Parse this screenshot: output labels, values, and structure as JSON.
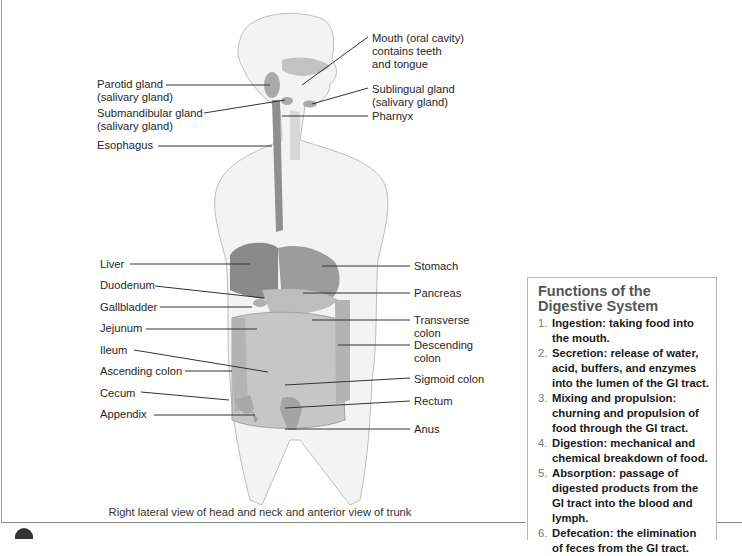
{
  "labels_left": [
    {
      "text": "Parotid gland\n(salivary gland)"
    },
    {
      "text": "Submandibular gland\n(salivary gland)"
    },
    {
      "text": "Esophagus"
    },
    {
      "text": "Liver"
    },
    {
      "text": "Duodenum"
    },
    {
      "text": "Gallbladder"
    },
    {
      "text": "Jejunum"
    },
    {
      "text": "Ileum"
    },
    {
      "text": "Ascending colon"
    },
    {
      "text": "Cecum"
    },
    {
      "text": "Appendix"
    }
  ],
  "labels_right": [
    {
      "text": "Mouth (oral cavity)\ncontains teeth\nand tongue"
    },
    {
      "text": "Sublingual gland\n(salivary gland)"
    },
    {
      "text": "Pharnyx"
    },
    {
      "text": "Stomach"
    },
    {
      "text": "Pancreas"
    },
    {
      "text": "Transverse\ncolon"
    },
    {
      "text": "Descending\ncolon"
    },
    {
      "text": "Sigmoid colon"
    },
    {
      "text": "Rectum"
    },
    {
      "text": "Anus"
    }
  ],
  "caption": "Right lateral view of head and neck and anterior view of trunk",
  "functions_box": {
    "title": "Functions of the Digestive System",
    "items": [
      {
        "num": "1.",
        "text": "Ingestion: taking food into the mouth."
      },
      {
        "num": "2.",
        "text": "Secretion: release of water, acid, buffers, and enzymes into the lumen of the GI tract."
      },
      {
        "num": "3.",
        "text": "Mixing and propulsion: churning and propulsion of food through the GI tract."
      },
      {
        "num": "4.",
        "text": "Digestion: mechanical and chemical breakdown of food."
      },
      {
        "num": "5.",
        "text": "Absorption: passage of digested products from the GI tract into the blood and lymph."
      },
      {
        "num": "6.",
        "text": "Defecation: the elimination of feces from the GI tract."
      }
    ]
  },
  "colors": {
    "organ_dark": "#8a8a8a",
    "organ_mid": "#b8b8b8",
    "organ_light": "#d4d4d4",
    "skin": "#f2f2f2",
    "heading": "#555555"
  }
}
